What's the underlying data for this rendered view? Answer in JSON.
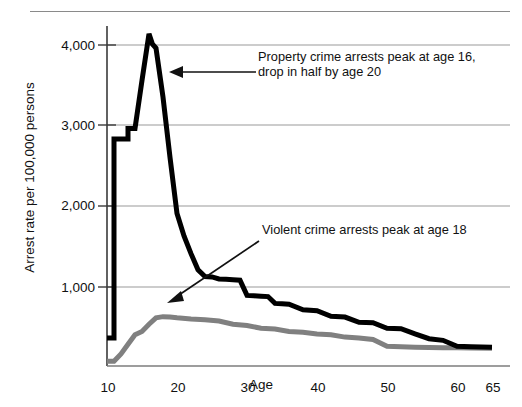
{
  "figure": {
    "name": "arrest-rate-by-age-chart",
    "top_rule": true
  },
  "chart_data": {
    "type": "line",
    "title": "",
    "subtitle": "",
    "xlabel": "Age",
    "ylabel": "Arrest rate per 100,000 persons",
    "xlim": [
      10,
      65
    ],
    "ylim": [
      0,
      4400
    ],
    "xticks": [
      10,
      20,
      30,
      40,
      50,
      60,
      65
    ],
    "xticklabels": [
      "10",
      "20",
      "30",
      "40",
      "50",
      "60",
      "65"
    ],
    "yticks": [
      1000,
      2000,
      3000,
      4000
    ],
    "yticklabels": [
      "1,000",
      "2,000",
      "3,000",
      "4,000"
    ],
    "grid": "horizontal",
    "legend": "none",
    "series": [
      {
        "name": "Property crime arrest rate",
        "color": "#000000",
        "width": 5,
        "x": [
          10,
          11,
          11,
          12,
          13,
          13,
          14,
          15,
          16,
          16.5,
          17,
          18,
          19,
          20,
          21,
          22,
          23,
          24,
          25,
          26,
          27,
          28,
          29,
          30,
          31,
          32,
          33,
          34,
          35,
          36,
          38,
          40,
          42,
          44,
          46,
          48,
          50,
          52,
          54,
          56,
          58,
          60,
          62,
          65
        ],
        "y": [
          350,
          350,
          2830,
          2830,
          2830,
          2960,
          2960,
          3560,
          4140,
          4010,
          3960,
          3350,
          2600,
          1900,
          1620,
          1400,
          1200,
          1115,
          1110,
          1085,
          1080,
          1075,
          1070,
          880,
          875,
          870,
          865,
          780,
          775,
          770,
          700,
          690,
          620,
          610,
          545,
          540,
          470,
          465,
          400,
          340,
          320,
          245,
          240,
          235
        ]
      },
      {
        "name": "Violent crime arrest rate",
        "color": "#808080",
        "width": 5,
        "x": [
          10,
          11,
          12,
          13,
          14,
          15,
          16,
          17,
          18,
          19,
          20,
          22,
          24,
          26,
          28,
          30,
          32,
          34,
          36,
          38,
          40,
          42,
          44,
          46,
          48,
          50,
          52,
          54,
          56,
          58,
          60,
          62,
          65
        ],
        "y": [
          60,
          60,
          150,
          270,
          390,
          430,
          520,
          600,
          615,
          610,
          600,
          585,
          575,
          560,
          520,
          505,
          470,
          460,
          430,
          420,
          400,
          390,
          360,
          350,
          330,
          245,
          240,
          235,
          230,
          228,
          226,
          224,
          222
        ]
      }
    ],
    "annotations": [
      {
        "id": "property-note",
        "text_lines": [
          "Property crime arrests peak at age 16,",
          "drop in half by age 20"
        ],
        "text_x": 258,
        "text_y": 56,
        "arrow": {
          "from_x": 256,
          "from_y": 72,
          "to_x": 172,
          "to_y": 72,
          "style": "straight-left"
        }
      },
      {
        "id": "violent-note",
        "text_lines": [
          "Violent crime arrests peak at age 18"
        ],
        "text_x": 262,
        "text_y": 229,
        "arrow": {
          "from_x": 259,
          "from_y": 241,
          "to_x": 169,
          "to_y": 302,
          "style": "diagonal-down-left"
        }
      }
    ]
  }
}
